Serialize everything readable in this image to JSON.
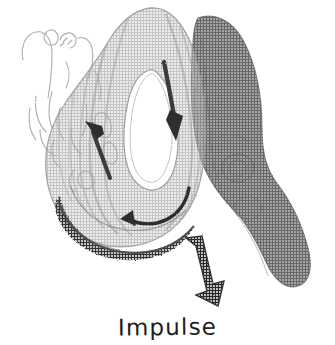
{
  "figure": {
    "kind": "hand-drawn-scanned-diagram",
    "background_color": "#ffffff",
    "caption": "Impulse",
    "caption_color": "#1d1d1d",
    "palette": {
      "ink": "#1d1d1d",
      "arrow_dark": "#333333",
      "wing_dark_gray": "#8e8e8e",
      "body_mid_gray": "#bdbdbd",
      "body_light_gray": "#d8d8d8",
      "sketch_faint": "#b9b9b9",
      "cavity_white": "#ffffff",
      "rim_dark": "#5a5a5a"
    },
    "parts": [
      {
        "name": "faint-sketch-outlines",
        "label": "faint hand-drawn loops",
        "color": "#b9b9b9"
      },
      {
        "name": "u-shaped-body",
        "label": "U-shaped shaded body",
        "color": "#cfcfcf"
      },
      {
        "name": "inner-cavity",
        "label": "white inner slit",
        "color": "#ffffff"
      },
      {
        "name": "dark-wing",
        "label": "dark gray wing",
        "color": "#8e8e8e"
      },
      {
        "name": "bottom-rim",
        "label": "dark textured rim",
        "color": "#5a5a5a"
      }
    ],
    "arrows": [
      {
        "name": "arrow-down-right-limb",
        "direction": "down",
        "color": "#333333"
      },
      {
        "name": "arrow-up-left-limb",
        "direction": "up-left",
        "color": "#333333"
      },
      {
        "name": "arrow-curved-bottom",
        "direction": "curved-left",
        "color": "#333333"
      },
      {
        "name": "arrow-impulse",
        "direction": "down",
        "color": "#3a3a3a",
        "label": "Impulse"
      }
    ]
  }
}
